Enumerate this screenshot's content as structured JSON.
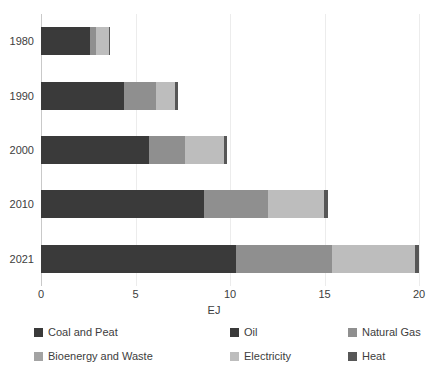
{
  "chart_data": {
    "type": "bar",
    "orientation": "horizontal",
    "stacked": true,
    "title": "",
    "xlabel": "EJ",
    "ylabel": "",
    "xlim": [
      0,
      20
    ],
    "xticks": [
      "0",
      "5",
      "10",
      "15",
      "20"
    ],
    "categories": [
      "1980",
      "1990",
      "2000",
      "2010",
      "2021"
    ],
    "grid": "vertical-only",
    "legend_position": "bottom",
    "series": [
      {
        "name": "Coal and Peat",
        "color": "#3a3a3a",
        "values": [
          2.6,
          4.4,
          5.7,
          8.6,
          10.3
        ]
      },
      {
        "name": "Oil",
        "color": "#3a3a3a",
        "values": [
          0.0,
          0.0,
          0.0,
          0.0,
          0.0
        ]
      },
      {
        "name": "Natural Gas",
        "color": "#8f8f8f",
        "values": [
          0.3,
          1.7,
          1.9,
          3.4,
          5.1
        ]
      },
      {
        "name": "Bioenergy and Waste",
        "color": "#a3a3a3",
        "values": [
          0.0,
          0.0,
          0.0,
          0.0,
          0.0
        ]
      },
      {
        "name": "Electricity",
        "color": "#bdbdbd",
        "values": [
          0.7,
          1.0,
          2.1,
          3.0,
          4.4
        ]
      },
      {
        "name": "Heat",
        "color": "#575757",
        "values": [
          0.05,
          0.15,
          0.15,
          0.2,
          0.2
        ]
      }
    ],
    "totals": [
      3.65,
      7.25,
      9.85,
      15.2,
      20.0
    ]
  },
  "axes": {
    "x_title": "EJ",
    "x_tick_labels": [
      "0",
      "5",
      "10",
      "15",
      "20"
    ],
    "y_tick_labels": [
      "1980",
      "1990",
      "2000",
      "2010",
      "2021"
    ]
  },
  "legend": {
    "items": [
      {
        "label": "Coal and Peat",
        "color": "#3a3a3a"
      },
      {
        "label": "Oil",
        "color": "#3a3a3a"
      },
      {
        "label": "Natural Gas",
        "color": "#8f8f8f"
      },
      {
        "label": "Bioenergy and Waste",
        "color": "#a3a3a3"
      },
      {
        "label": "Electricity",
        "color": "#bdbdbd"
      },
      {
        "label": "Heat",
        "color": "#575757"
      }
    ]
  }
}
